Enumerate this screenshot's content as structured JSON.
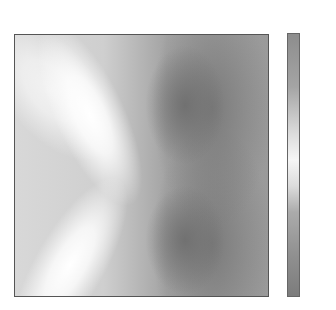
{
  "chart_data": {
    "type": "heatmap",
    "subtitle": "Best Individual: 8.21",
    "xlabel": "",
    "ylabel": "",
    "axes_ticks_visible": false,
    "colorbar": {
      "ticks": [
        20,
        15,
        10,
        5,
        0,
        -5,
        -10
      ],
      "tick_labels": [
        "20",
        "15",
        "10",
        "5",
        "0",
        "−5",
        "−10"
      ],
      "range": [
        -11,
        23
      ],
      "colormap": "grayscale (diverging, light near ~7)"
    },
    "scatter_points_px": [
      {
        "x": 77,
        "y": 107
      },
      {
        "x": 109,
        "y": 100
      },
      {
        "x": 77,
        "y": 201
      },
      {
        "x": 82,
        "y": 209
      },
      {
        "x": 66,
        "y": 235
      }
    ],
    "population_size": 6,
    "generation": 2,
    "best_individual": 8.21,
    "grid": false,
    "legend": null
  },
  "title_line1": "Population size: 6, Generation: 2",
  "title_line2": "Best Individual: 8.21"
}
